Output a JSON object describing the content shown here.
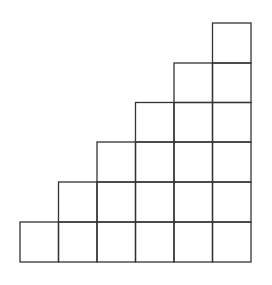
{
  "diagram": {
    "type": "staircase-grid",
    "columns": 6,
    "column_heights": [
      1,
      2,
      3,
      4,
      5,
      6
    ],
    "total_cells": 21,
    "x_lines": [
      20,
      58.5,
      97,
      135.5,
      174,
      212.5,
      251
    ],
    "y_lines": [
      23,
      63,
      102.5,
      142,
      182,
      222,
      262
    ],
    "stroke_color": "#333333",
    "background_color": "#ffffff"
  }
}
